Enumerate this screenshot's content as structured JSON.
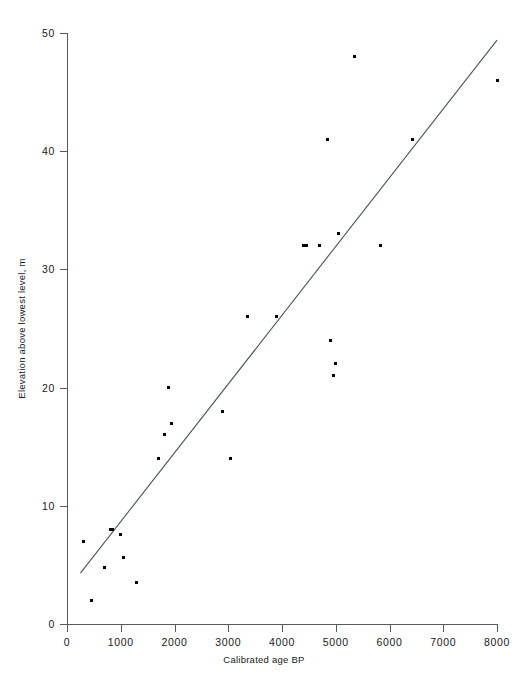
{
  "chart_data": {
    "type": "scatter",
    "title": "",
    "xlabel": "Calibrated age BP",
    "ylabel": "Elevation above lowest level, m",
    "xlim": [
      0,
      8000
    ],
    "ylim": [
      0,
      50
    ],
    "xticks": [
      0,
      1000,
      2000,
      3000,
      4000,
      5000,
      6000,
      7000,
      8000
    ],
    "yticks": [
      0,
      10,
      20,
      30,
      40,
      50
    ],
    "xtick_labels": [
      "0",
      "1000",
      "2000",
      "3000",
      "4000",
      "5000",
      "6000",
      "7000",
      "8000"
    ],
    "ytick_labels": [
      "0",
      "10",
      "20",
      "30",
      "40",
      "50"
    ],
    "grid": false,
    "legend": null,
    "marker": "square-dot",
    "marker_color": "#000000",
    "axis_color": "#555b5e",
    "points": [
      {
        "x": 300,
        "y": 7.0
      },
      {
        "x": 450,
        "y": 2.0
      },
      {
        "x": 700,
        "y": 4.8
      },
      {
        "x": 800,
        "y": 8.0
      },
      {
        "x": 850,
        "y": 8.0
      },
      {
        "x": 1000,
        "y": 7.6
      },
      {
        "x": 1050,
        "y": 5.6
      },
      {
        "x": 1300,
        "y": 3.5
      },
      {
        "x": 1700,
        "y": 14.0
      },
      {
        "x": 1820,
        "y": 16.0
      },
      {
        "x": 1880,
        "y": 20.0
      },
      {
        "x": 1950,
        "y": 17.0
      },
      {
        "x": 2900,
        "y": 18.0
      },
      {
        "x": 3050,
        "y": 14.0
      },
      {
        "x": 3350,
        "y": 26.0
      },
      {
        "x": 3900,
        "y": 26.0
      },
      {
        "x": 4400,
        "y": 32.0
      },
      {
        "x": 4450,
        "y": 32.0
      },
      {
        "x": 4700,
        "y": 32.0
      },
      {
        "x": 4850,
        "y": 41.0
      },
      {
        "x": 4900,
        "y": 24.0
      },
      {
        "x": 4950,
        "y": 21.0
      },
      {
        "x": 5000,
        "y": 22.0
      },
      {
        "x": 5050,
        "y": 33.0
      },
      {
        "x": 5350,
        "y": 48.0
      },
      {
        "x": 5830,
        "y": 32.0
      },
      {
        "x": 6430,
        "y": 41.0
      },
      {
        "x": 8000,
        "y": 46.0
      }
    ],
    "fit_line": {
      "type": "linear-regression",
      "x_start": 250,
      "y_start": 4.3,
      "x_end": 8000,
      "y_end": 49.4,
      "color": "#4d5356"
    }
  }
}
